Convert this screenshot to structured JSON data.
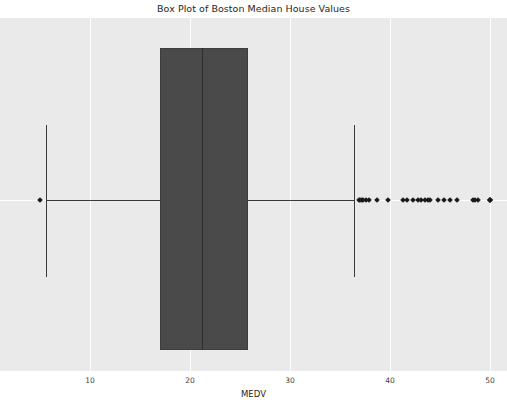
{
  "chart_data": {
    "type": "box",
    "title": "Box Plot of Boston Median House Values",
    "xlabel": "MEDV",
    "ylabel": "",
    "orientation": "horizontal",
    "grid": true,
    "legend": null,
    "xlim": [
      1.0,
      51.7
    ],
    "xticks": [
      10,
      20,
      30,
      40,
      50
    ],
    "xticklabels": [
      "10",
      "20",
      "30",
      "40",
      "50"
    ],
    "box_color": "#4a4a4a",
    "line_color": "#3a3a3a",
    "flier_color": "#1a1a1a",
    "background_color": "#eaeaea",
    "grid_color": "#ffffff",
    "series": [
      {
        "name": "MEDV",
        "q1": 17.0,
        "median": 21.2,
        "q3": 25.8,
        "whisker_low": 5.6,
        "whisker_high": 36.4,
        "fliers": [
          5.0,
          36.9,
          37.0,
          37.2,
          37.3,
          37.6,
          37.9,
          38.7,
          39.8,
          41.3,
          41.7,
          42.3,
          42.8,
          43.1,
          43.5,
          43.8,
          44.0,
          44.8,
          45.4,
          46.0,
          46.7,
          48.3,
          48.5,
          48.8,
          50.0,
          50.0,
          50.0,
          50.0
        ]
      }
    ]
  },
  "axis": {
    "tick_labels": [
      "10",
      "20",
      "30",
      "40",
      "50"
    ],
    "x_label": "MEDV"
  },
  "title": {
    "text": "Box Plot of Boston Median House Values"
  }
}
